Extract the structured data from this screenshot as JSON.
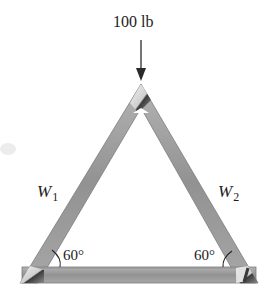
{
  "diagram": {
    "type": "statics-truss",
    "load": {
      "label": "100 lb",
      "direction": "down",
      "applied_at": "apex"
    },
    "members": [
      {
        "id": "left",
        "label_main": "W",
        "label_sub": "1"
      },
      {
        "id": "right",
        "label_main": "W",
        "label_sub": "2"
      },
      {
        "id": "bottom",
        "label_main": "",
        "label_sub": ""
      }
    ],
    "angles": [
      {
        "position": "bottom-left",
        "label": "60°"
      },
      {
        "position": "bottom-right",
        "label": "60°"
      }
    ],
    "colors": {
      "member_fill": "#9a9a9a",
      "member_edge": "#7a7a7a",
      "joint_light": "#e8e8e8",
      "joint_dark": "#4a4a4a",
      "text": "#1c1c1c",
      "arrow": "#2a2a2a"
    }
  }
}
